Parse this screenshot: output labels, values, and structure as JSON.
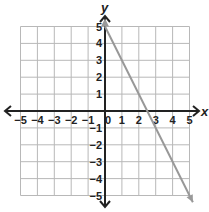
{
  "chart_data": {
    "type": "line",
    "title": "",
    "xlabel": "x",
    "ylabel": "y",
    "xlim": [
      -5,
      5
    ],
    "ylim": [
      -5,
      5
    ],
    "grid": true,
    "x_ticks": [
      -5,
      -4,
      -3,
      -2,
      -1,
      0,
      1,
      2,
      3,
      4,
      5
    ],
    "y_ticks": [
      -5,
      -4,
      -3,
      -2,
      -1,
      1,
      2,
      3,
      4,
      5
    ],
    "x_tick_labels": [
      "−5",
      "−4",
      "−3",
      "−2",
      "−1",
      "0",
      "1",
      "2",
      "3",
      "4",
      "5"
    ],
    "y_tick_labels": [
      "−5",
      "−4",
      "−3",
      "−2",
      "−1",
      "1",
      "2",
      "3",
      "4",
      "5"
    ],
    "series": [
      {
        "name": "line",
        "equation": "y = -2x + 5",
        "x": [
          0,
          2.5,
          5.2
        ],
        "y": [
          5,
          0,
          -5.4
        ],
        "color": "#999999",
        "arrow_end": true
      }
    ]
  },
  "colors": {
    "grid": "#b8b8b8",
    "axis": "#222222",
    "line": "#999999"
  }
}
